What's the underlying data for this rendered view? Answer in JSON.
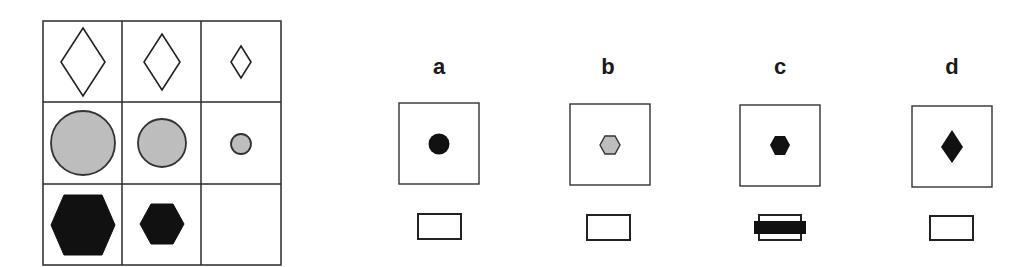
{
  "matrix": {
    "rows": [
      {
        "shape": "diamond",
        "fill": "#ffffff",
        "stroke": "#222222",
        "sizes": [
          "large",
          "medium",
          "small"
        ]
      },
      {
        "shape": "circle",
        "fill": "#bdbdbd",
        "stroke": "#333333",
        "sizes": [
          "large",
          "medium",
          "small"
        ]
      },
      {
        "shape": "hexagon",
        "fill": "#111111",
        "stroke": "#111111",
        "sizes": [
          "large",
          "medium",
          "missing"
        ]
      }
    ],
    "missing_cell": "row-3-col-3"
  },
  "options": [
    {
      "label": "a",
      "shape": "circle",
      "fill": "#111111",
      "size": "small"
    },
    {
      "label": "b",
      "shape": "hexagon",
      "fill": "#bdbdbd",
      "size": "small"
    },
    {
      "label": "c",
      "shape": "hexagon",
      "fill": "#111111",
      "size": "small",
      "selected": true
    },
    {
      "label": "d",
      "shape": "diamond",
      "fill": "#111111",
      "size": "small"
    }
  ],
  "colors": {
    "line": "#2a2a2a",
    "gray": "#bdbdbd",
    "black": "#111111"
  }
}
